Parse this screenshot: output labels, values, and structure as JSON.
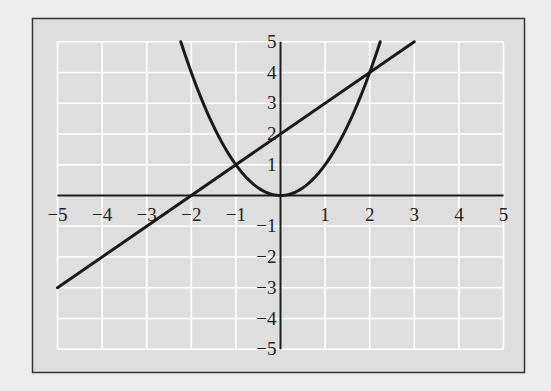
{
  "chart_data": {
    "type": "line",
    "title": "",
    "xlabel": "",
    "ylabel": "",
    "xlim": [
      -5,
      5
    ],
    "ylim": [
      -5,
      5
    ],
    "grid": true,
    "x_ticks": [
      -5,
      -4,
      -3,
      -2,
      -1,
      1,
      2,
      3,
      4,
      5
    ],
    "y_ticks": [
      5,
      4,
      3,
      2,
      1,
      -1,
      -2,
      -3,
      -4,
      -5
    ],
    "x_tick_labels": [
      "−5",
      "−4",
      "−3",
      "−2",
      "−1",
      "1",
      "2",
      "3",
      "4",
      "5"
    ],
    "y_tick_labels": [
      "5",
      "4",
      "3",
      "2",
      "1",
      "−1",
      "−2",
      "−3",
      "−4",
      "−5"
    ],
    "series": [
      {
        "name": "parabola",
        "equation": "y = x^2",
        "x_range": [
          -2.236,
          2.236
        ],
        "points": [
          [
            -2.236,
            5
          ],
          [
            -2,
            4
          ],
          [
            -1,
            1
          ],
          [
            0,
            0
          ],
          [
            1,
            1
          ],
          [
            2,
            4
          ],
          [
            2.236,
            5
          ]
        ]
      },
      {
        "name": "line",
        "equation": "y = x + 2",
        "x_range": [
          -5,
          3
        ],
        "points": [
          [
            -5,
            -3
          ],
          [
            -2,
            0
          ],
          [
            -1,
            1
          ],
          [
            0,
            2
          ],
          [
            2,
            4
          ],
          [
            3,
            5
          ]
        ]
      }
    ],
    "intersections": [
      [
        -1,
        1
      ],
      [
        2,
        4
      ]
    ],
    "legend": null
  },
  "colors": {
    "page_background": "#ececec",
    "plot_background": "#dedede",
    "grid": "#ffffff",
    "axes": "#1a1a1a",
    "curves": "#1a1a1a",
    "frame": "#333333"
  }
}
